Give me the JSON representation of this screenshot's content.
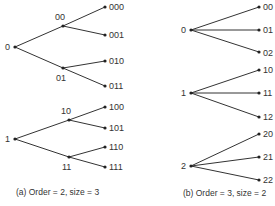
{
  "figure_a": {
    "caption": "(a) Order = 2, size = 3",
    "roots": [
      {
        "label": "0",
        "children": [
          {
            "label": "00",
            "children": [
              "000",
              "001"
            ]
          },
          {
            "label": "01",
            "children": [
              "010",
              "011"
            ]
          }
        ]
      },
      {
        "label": "1",
        "children": [
          {
            "label": "10",
            "children": [
              "100",
              "101"
            ]
          },
          {
            "label": "11",
            "children": [
              "110",
              "111"
            ]
          }
        ]
      }
    ]
  },
  "figure_b": {
    "caption": "(b) Order = 3, size = 2",
    "roots": [
      {
        "label": "0",
        "children": [
          "00",
          "01",
          "02"
        ]
      },
      {
        "label": "1",
        "children": [
          "10",
          "11",
          "12"
        ]
      },
      {
        "label": "2",
        "children": [
          "20",
          "21",
          "22"
        ]
      }
    ]
  },
  "colors": {
    "line": "#333333",
    "node": "#222222",
    "text": "#333333"
  }
}
